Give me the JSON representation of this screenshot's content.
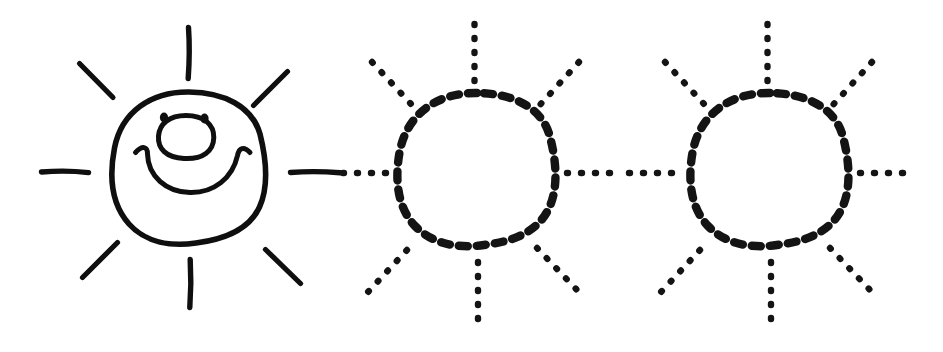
{
  "worksheet": {
    "type": "tracing-worksheet",
    "subject": "sun",
    "title": "",
    "background_color": "#ffffff",
    "ink_color": "#100f0f",
    "canvas": {
      "width": 943,
      "height": 352
    }
  },
  "figures": [
    {
      "id": "sun-solid",
      "label": "sun-with-face",
      "style": "solid",
      "has_face": true,
      "center": {
        "x": 189,
        "y": 167
      },
      "radius": 76,
      "ray_count": 8,
      "face": {
        "eyes": [
          {
            "x": 164,
            "y": 117,
            "rx": 4,
            "ry": 5
          },
          {
            "x": 204,
            "y": 117,
            "rx": 4,
            "ry": 5
          }
        ],
        "nose": {
          "x": 186,
          "y": 137,
          "rx": 27,
          "ry": 22
        },
        "mouth": "wide-smile-with-curled-ends"
      }
    },
    {
      "id": "sun-dotted-1",
      "label": "sun-tracing-outline",
      "style": "dotted",
      "has_face": false,
      "center": {
        "x": 477,
        "y": 171
      },
      "radius": 80,
      "ray_count": 8,
      "ray_dots_per_ray": 5
    },
    {
      "id": "sun-dotted-2",
      "label": "sun-tracing-outline",
      "style": "dotted",
      "has_face": false,
      "center": {
        "x": 770,
        "y": 171
      },
      "radius": 80,
      "ray_count": 8,
      "ray_dots_per_ray": 5
    }
  ]
}
